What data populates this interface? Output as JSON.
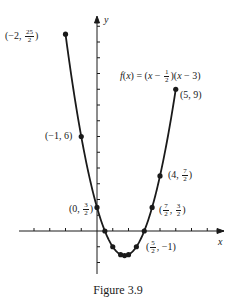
{
  "chart_data": {
    "type": "line",
    "title": "",
    "caption": "Figure 3.9",
    "function_label": "f(x) = (x − 1/2)(x − 3)",
    "xlabel": "x",
    "ylabel": "y",
    "xlim": [
      -5,
      8
    ],
    "ylim": [
      -3,
      14
    ],
    "x_ticks": [
      -4,
      -3,
      -2,
      -1,
      1,
      2,
      3,
      4,
      5,
      6,
      7
    ],
    "y_ticks": [
      -2,
      -1,
      1,
      2,
      3,
      4,
      5,
      6,
      7,
      8,
      9,
      10,
      11,
      12,
      13
    ],
    "grid": false,
    "curve": {
      "expression": "(x - 0.5) * (x - 3)",
      "x_range": [
        -2,
        5
      ]
    },
    "points": [
      {
        "x": -2,
        "y": 12.5,
        "label": "(−2, 25/2)"
      },
      {
        "x": -1,
        "y": 6,
        "label": "(−1, 6)"
      },
      {
        "x": 0,
        "y": 1.5,
        "label": "(0, 3/2)"
      },
      {
        "x": 0.5,
        "y": 0,
        "label": ""
      },
      {
        "x": 1,
        "y": -1,
        "label": ""
      },
      {
        "x": 1.5,
        "y": -1.5,
        "label": ""
      },
      {
        "x": 1.75,
        "y": -1.5625,
        "label": ""
      },
      {
        "x": 2,
        "y": -1.5,
        "label": ""
      },
      {
        "x": 2.5,
        "y": -1,
        "label": "(5/2, −1)"
      },
      {
        "x": 3,
        "y": 0,
        "label": ""
      },
      {
        "x": 3.5,
        "y": 1.5,
        "label": "(7/2, 3/2)"
      },
      {
        "x": 4,
        "y": 3.5,
        "label": "(4, 7/2)"
      },
      {
        "x": 5,
        "y": 9,
        "label": "(5, 9)"
      }
    ]
  },
  "labels": {
    "p1": {
      "pre": "(−2, ",
      "num": "25",
      "den": "2",
      "post": ")"
    },
    "p2": {
      "text": "(−1, 6)"
    },
    "p3": {
      "pre": "(0, ",
      "num": "3",
      "den": "2",
      "post": ")"
    },
    "p4": {
      "pre": "(",
      "num": "5",
      "den": "2",
      "post": ", −1)"
    },
    "p5": {
      "pre": "(",
      "num": "7",
      "den": "2",
      "mid": ", ",
      "num2": "3",
      "den2": "2",
      "post": ")"
    },
    "p6": {
      "pre": "(4, ",
      "num": "7",
      "den": "2",
      "post": ")"
    },
    "p7": {
      "text": "(5, 9)"
    },
    "func": {
      "f": "f",
      "open": "(",
      "x": "x",
      "eq": ") = (",
      "x2": "x",
      "minus": " − ",
      "num": "1",
      "den": "2",
      "mid": ")(",
      "x3": "x",
      "tail": " − 3)"
    },
    "xaxis": "x",
    "yaxis": "y",
    "caption": "Figure 3.9"
  }
}
